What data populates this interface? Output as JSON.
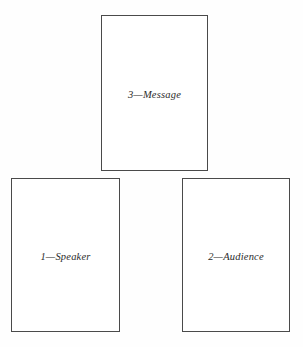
{
  "diagram": {
    "background_color": "#fefefe",
    "border_color": "#4a4a4a",
    "text_color": "#2b2b2b",
    "boxes": [
      {
        "id": "speaker",
        "label": "1—Speaker",
        "number": "1",
        "name": "Speaker"
      },
      {
        "id": "audience",
        "label": "2—Audience",
        "number": "2",
        "name": "Audience"
      },
      {
        "id": "message",
        "label": "3—Message",
        "number": "3",
        "name": "Message"
      }
    ]
  }
}
